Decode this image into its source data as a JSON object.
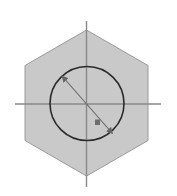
{
  "document": {
    "type": "technical-drawing",
    "title": "Hexagon with Inscribed Circle",
    "width": 177,
    "height": 196,
    "background_color": "#ffffff"
  },
  "colors": {
    "background": "#ffffff",
    "hexagon_fill": "#c9c9c9",
    "hexagon_stroke": "#9a9a9a",
    "circle_stroke": "#2b2b2b",
    "centerline_stroke": "#888888",
    "dimension_stroke": "#666666",
    "marker_fill": "#6e6e6e"
  },
  "shapes": {
    "hexagon": {
      "name": "hexagon-outline",
      "center_x": 86.5,
      "center_y": 103.5,
      "vertices": [
        {
          "x": 86.5,
          "y": 30.0
        },
        {
          "x": 148.0,
          "y": 65.5
        },
        {
          "x": 148.0,
          "y": 140.5
        },
        {
          "x": 86.5,
          "y": 176.0
        },
        {
          "x": 25.0,
          "y": 140.5
        },
        {
          "x": 25.0,
          "y": 65.5
        }
      ],
      "points_attr": "86.5,30 148,65.5 148,140.5 86.5,176 25,140.5 25,65.5",
      "fill": "#c9c9c9",
      "stroke": "#9a9a9a",
      "stroke_width": 1
    },
    "circle": {
      "name": "inscribed-circle",
      "center_x": 87,
      "center_y": 103.5,
      "radius": 37,
      "fill": "none",
      "stroke": "#2b2b2b",
      "stroke_width": 1.6
    },
    "centerline_horizontal": {
      "name": "horizontal-centerline",
      "x1": 15,
      "y1": 104,
      "x2": 161,
      "y2": 104,
      "stroke": "#888888",
      "stroke_width": 1.4
    },
    "centerline_vertical": {
      "name": "vertical-centerline",
      "x1": 86.5,
      "y1": 21,
      "x2": 86.5,
      "y2": 187,
      "stroke": "#888888",
      "stroke_width": 1.4
    },
    "diameter_dimension": {
      "name": "diameter-dimension-line",
      "x1": 62,
      "y1": 76,
      "x2": 112.5,
      "y2": 133.5,
      "stroke": "#666666",
      "stroke_width": 1.1,
      "arrow_start": true,
      "arrow_end": true
    },
    "dimension_marker": {
      "name": "dimension-text-marker",
      "x": 95,
      "y": 119.5,
      "width": 5,
      "height": 5.5,
      "fill": "#6e6e6e"
    }
  }
}
